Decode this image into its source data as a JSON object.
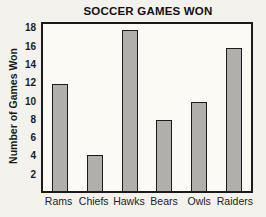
{
  "chart_data": {
    "type": "bar",
    "title": "SOCCER GAMES WON",
    "categories": [
      "Rams",
      "Chiefs",
      "Hawks",
      "Bears",
      "Owls",
      "Raiders"
    ],
    "values": [
      12,
      4,
      18,
      8,
      10,
      16
    ],
    "xlabel": "",
    "ylabel": "Number of Games Won",
    "ylim": [
      0,
      18.7
    ],
    "yticks": [
      2,
      4,
      6,
      8,
      10,
      12,
      14,
      16,
      18
    ],
    "grid": false,
    "legend_position": "none",
    "colors": {
      "bar_fill": "#b0afab",
      "bar_border": "#1b1b1b",
      "plot_border": "#1b1b1b",
      "plot_background": "#fbfaf5",
      "page_background": "#f4f2ec",
      "text": "#1c1c1c"
    }
  }
}
